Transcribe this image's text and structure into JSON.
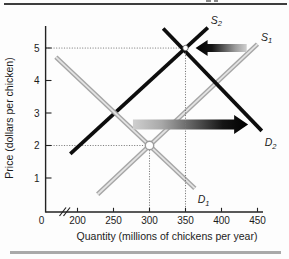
{
  "figure": {
    "top_rule_color": "#3d3d3d",
    "bottom_rule_color": "#a9a9a9",
    "remnant_color": "#8a8a8a"
  },
  "chart_data": {
    "type": "line",
    "title": "",
    "xlabel": "Quantity (millions of chickens per year)",
    "ylabel": "Price (dollars per chicken)",
    "x_origin_label": "0",
    "axis_break_between": [
      0,
      200
    ],
    "x_ticks": [
      200,
      250,
      300,
      350,
      400,
      450
    ],
    "y_ticks": [
      1,
      2,
      3,
      4,
      5
    ],
    "xlim": [
      150,
      470
    ],
    "ylim": [
      0,
      5.8
    ],
    "grid": false,
    "series": [
      {
        "name": "S",
        "sub": "1",
        "role": "initial-supply",
        "color": "gray",
        "points": [
          [
            228,
            0.5
          ],
          [
            450,
            5.12
          ]
        ],
        "label_q": 455,
        "label_p": 5.22
      },
      {
        "name": "S",
        "sub": "2",
        "role": "new-supply",
        "color": "black",
        "points": [
          [
            190,
            1.74
          ],
          [
            381,
            5.63
          ]
        ],
        "label_q": 385,
        "label_p": 5.74
      },
      {
        "name": "D",
        "sub": "1",
        "role": "initial-demand",
        "color": "gray",
        "points": [
          [
            170,
            4.72
          ],
          [
            363,
            0.68
          ]
        ],
        "label_q": 367,
        "label_p": 0.23
      },
      {
        "name": "D",
        "sub": "2",
        "role": "new-demand",
        "color": "black",
        "points": [
          [
            319,
            5.6
          ],
          [
            456,
            2.45
          ]
        ],
        "label_q": 460,
        "label_p": 1.98
      }
    ],
    "equilibria": [
      {
        "q": 300,
        "p": 2,
        "style": "open-circle-gray"
      },
      {
        "q": 350,
        "p": 5,
        "style": "open-circle-black"
      }
    ],
    "shift_arrows": [
      {
        "for": "supply",
        "direction": "left",
        "from_q": 435,
        "to_q": 364,
        "at_p": 5.0
      },
      {
        "for": "demand",
        "direction": "right",
        "from_q": 277,
        "to_q": 437,
        "at_p": 2.65
      }
    ],
    "colors": {
      "black_curve": "#0d0d0d",
      "gray_curve_edge": "#a6a6a6",
      "gray_curve_core": "#e3e3e3",
      "dotted": "#777777",
      "axis": "#222222",
      "text": "#1c1c1c",
      "arrow_dark": "#000000",
      "arrow_light": "#cfcfcf"
    }
  }
}
